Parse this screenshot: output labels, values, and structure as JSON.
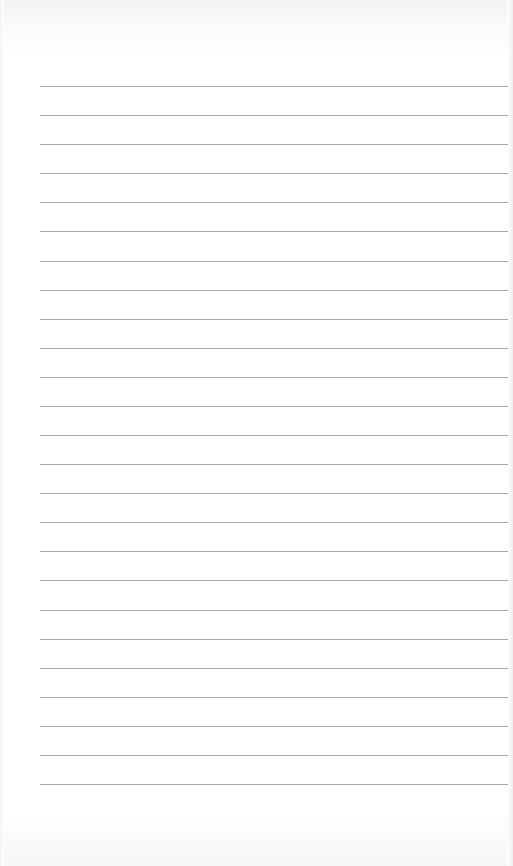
{
  "page": {
    "type": "lined-paper",
    "line_count": 25,
    "line_color": "#a9a9a9",
    "paper_color": "#ffffff",
    "text": ""
  }
}
